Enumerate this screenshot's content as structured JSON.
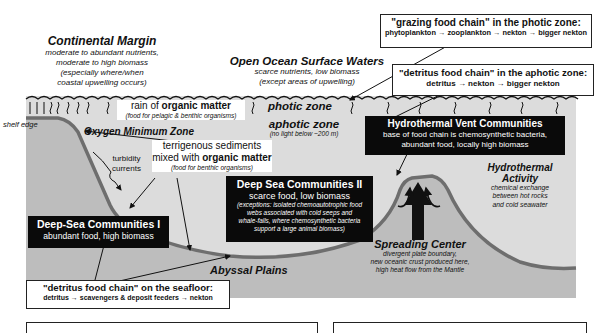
{
  "regions": {
    "continental_margin": {
      "title": "Continental Margin",
      "lines": [
        "moderate to abundant nutrients,",
        "moderate to high biomass",
        "(especially where/when",
        "coastal upwelling occurs)"
      ]
    },
    "open_ocean": {
      "title": "Open Ocean Surface Waters",
      "lines": [
        "scarce nutrients, low biomass",
        "(except areas of upwelling)"
      ]
    }
  },
  "food_chains": {
    "grazing": {
      "title": "\"grazing food chain\" in the photic zone:",
      "chain": "phytoplankton → zooplankton → nekton → bigger nekton"
    },
    "detritus_aphotic": {
      "title": "\"detritus food chain\" in the aphotic zone:",
      "chain": "detritus → nekton → bigger nekton"
    },
    "detritus_seafloor": {
      "title": "\"detritus food chain\" on the seafloor:",
      "chain": "detritus → scavengers & deposit feeders → nekton"
    }
  },
  "labels": {
    "rain_prefix": "rain of ",
    "rain_bold": "organic matter",
    "rain_sub": "(food for pelagic & benthic organisms)",
    "photic_zone": "photic zone",
    "aphotic_zone": "aphotic zone",
    "aphotic_sub": "(no light below ~200 m)",
    "shelf_edge": "shelf edge",
    "oxygen_min": "Oxygen Minimum Zone",
    "terrigenous_1": "terrigenous sediments",
    "terrigenous_2_prefix": "mixed with ",
    "terrigenous_2_bold": "organic matter",
    "terrigenous_sub": "(food for benthic organisms)",
    "turbidity_1": "turbidity",
    "turbidity_2": "currents",
    "abyssal_plains": "Abyssal Plains"
  },
  "communities": {
    "deep_sea_1": {
      "title": "Deep-Sea Communities I",
      "sub": "abundant food, high biomass"
    },
    "deep_sea_2": {
      "title": "Deep Sea Communities II",
      "sub": "scarce food, low biomass",
      "notes": [
        "(exceptions:  isolated chemoautotrophic food",
        "webs associated with cold seeps and",
        "whale-falls, where chemosynthetic bacteria",
        "support a large animal biomass)"
      ]
    },
    "vents": {
      "title": "Hydrothermal Vent Communities",
      "lines": [
        "base of food chain is chemosynthetic bacteria,",
        "abundant food, locally high biomass"
      ]
    }
  },
  "hydrothermal": {
    "title_1": "Hydrothermal",
    "title_2": "Activity",
    "lines": [
      "chemical exchange",
      "between hot rocks",
      "and cold seawater"
    ]
  },
  "spreading_center": {
    "title": "Spreading Center",
    "lines": [
      "divergent plate boundary,",
      "new oceanic crust produced here,",
      "high heat flow from the Mantle"
    ]
  },
  "colors": {
    "water": "#dcdcdc",
    "seafloor_fill": "#bdbdbd",
    "seafloor_line": "#6e6e6e",
    "black_box": "#0a0a0a"
  }
}
